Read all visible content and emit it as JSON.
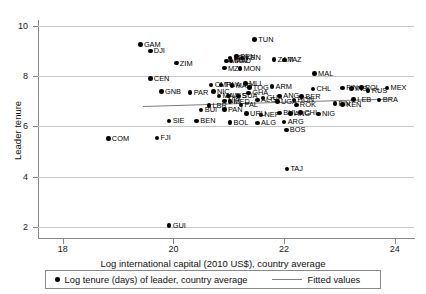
{
  "chart_data": {
    "type": "scatter",
    "title": "",
    "xlabel": "Log international capital (2010 US$), country average",
    "ylabel": "Leader tenure",
    "xlim": [
      17.55,
      24.35
    ],
    "ylim": [
      1.55,
      10.25
    ],
    "xticks": [
      18,
      20,
      22,
      24
    ],
    "yticks": [
      2,
      4,
      6,
      8,
      10
    ],
    "grid": "horizontal",
    "legend_position": "bottom",
    "legend": [
      {
        "marker": "circle",
        "label": "Log tenure (days) of leader, country average"
      },
      {
        "marker": "line",
        "label": "Fitted values"
      }
    ],
    "fit_line": {
      "x0": 19.45,
      "y0": 6.82,
      "x1": 23.95,
      "y1": 7.12
    },
    "points": [
      {
        "label": "GAM",
        "x": 19.4,
        "y": 9.28
      },
      {
        "label": "DJI",
        "x": 19.58,
        "y": 9.02
      },
      {
        "label": "TUN",
        "x": 21.47,
        "y": 9.48
      },
      {
        "label": "ZIM",
        "x": 20.05,
        "y": 8.53
      },
      {
        "label": "SEN",
        "x": 21.14,
        "y": 8.8
      },
      {
        "label": "BEN",
        "x": 21.02,
        "y": 8.74
      },
      {
        "label": "KEN",
        "x": 21.24,
        "y": 8.74
      },
      {
        "label": "MAW",
        "x": 20.96,
        "y": 8.62
      },
      {
        "label": "MAU",
        "x": 21.04,
        "y": 8.62
      },
      {
        "label": "ZAM",
        "x": 21.82,
        "y": 8.68
      },
      {
        "label": "TAZ",
        "x": 22.01,
        "y": 8.66
      },
      {
        "label": "MZ",
        "x": 20.92,
        "y": 8.33
      },
      {
        "label": "MON",
        "x": 21.2,
        "y": 8.32
      },
      {
        "label": "CEN",
        "x": 19.58,
        "y": 7.92
      },
      {
        "label": "MAL",
        "x": 22.55,
        "y": 8.12
      },
      {
        "label": "GNB",
        "x": 19.78,
        "y": 7.4
      },
      {
        "label": "PAR",
        "x": 20.3,
        "y": 7.36
      },
      {
        "label": "CMR",
        "x": 20.68,
        "y": 7.66
      },
      {
        "label": "TWA",
        "x": 20.86,
        "y": 7.66
      },
      {
        "label": "MAD",
        "x": 21.06,
        "y": 7.64
      },
      {
        "label": "MLI",
        "x": 21.3,
        "y": 7.72
      },
      {
        "label": "TOG",
        "x": 21.37,
        "y": 7.56
      },
      {
        "label": "ARM",
        "x": 21.78,
        "y": 7.6
      },
      {
        "label": "CHL",
        "x": 22.52,
        "y": 7.5
      },
      {
        "label": "FIN",
        "x": 23.06,
        "y": 7.54
      },
      {
        "label": "INS",
        "x": 23.22,
        "y": 7.52
      },
      {
        "label": "POL",
        "x": 23.4,
        "y": 7.56
      },
      {
        "label": "RUS",
        "x": 23.52,
        "y": 7.44
      },
      {
        "label": "MEX",
        "x": 23.86,
        "y": 7.54
      },
      {
        "label": "NIC",
        "x": 20.72,
        "y": 7.4
      },
      {
        "label": "GHA",
        "x": 21.36,
        "y": 7.34
      },
      {
        "label": "LES",
        "x": 21.0,
        "y": 7.22
      },
      {
        "label": "SUA",
        "x": 21.18,
        "y": 7.22
      },
      {
        "label": "MAA",
        "x": 20.82,
        "y": 7.22
      },
      {
        "label": "ANG",
        "x": 21.92,
        "y": 7.22
      },
      {
        "label": "BER",
        "x": 22.32,
        "y": 7.2
      },
      {
        "label": "LEB",
        "x": 23.26,
        "y": 7.08
      },
      {
        "label": "BRA",
        "x": 23.72,
        "y": 7.06
      },
      {
        "label": "NIR",
        "x": 20.92,
        "y": 7.02
      },
      {
        "label": "MED",
        "x": 21.02,
        "y": 7.0
      },
      {
        "label": "ALG",
        "x": 21.52,
        "y": 7.06
      },
      {
        "label": "GUA",
        "x": 21.62,
        "y": 7.14
      },
      {
        "label": "UGA",
        "x": 21.88,
        "y": 7.0
      },
      {
        "label": "HON",
        "x": 22.18,
        "y": 7.06
      },
      {
        "label": "LBR",
        "x": 20.64,
        "y": 6.84
      },
      {
        "label": "PAL",
        "x": 21.22,
        "y": 6.86
      },
      {
        "label": "ROK",
        "x": 22.22,
        "y": 6.86
      },
      {
        "label": "FIN2",
        "x": 22.92,
        "y": 6.92
      },
      {
        "label": "KEN2",
        "x": 23.06,
        "y": 6.88
      },
      {
        "label": "BUI",
        "x": 20.5,
        "y": 6.66
      },
      {
        "label": "PAN",
        "x": 20.92,
        "y": 6.68
      },
      {
        "label": "URU",
        "x": 21.32,
        "y": 6.52
      },
      {
        "label": "NEP",
        "x": 21.58,
        "y": 6.46
      },
      {
        "label": "BUL",
        "x": 21.92,
        "y": 6.54
      },
      {
        "label": "ANG2",
        "x": 22.12,
        "y": 6.52
      },
      {
        "label": "CHI",
        "x": 22.3,
        "y": 6.56
      },
      {
        "label": "NIG",
        "x": 22.62,
        "y": 6.5
      },
      {
        "label": "SIE",
        "x": 19.92,
        "y": 6.22
      },
      {
        "label": "BEN2",
        "x": 20.42,
        "y": 6.22
      },
      {
        "label": "BOL",
        "x": 21.02,
        "y": 6.16
      },
      {
        "label": "ALG2",
        "x": 21.52,
        "y": 6.14
      },
      {
        "label": "ARG",
        "x": 22.0,
        "y": 6.18
      },
      {
        "label": "BOS",
        "x": 22.04,
        "y": 5.86
      },
      {
        "label": "COM",
        "x": 18.82,
        "y": 5.52
      },
      {
        "label": "FJI",
        "x": 19.7,
        "y": 5.54
      },
      {
        "label": "TAJ",
        "x": 22.05,
        "y": 4.3
      },
      {
        "label": "GUI",
        "x": 19.92,
        "y": 2.04
      }
    ]
  }
}
